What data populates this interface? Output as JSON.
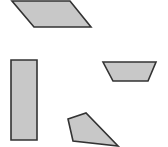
{
  "diagram": {
    "background": "#ffffff",
    "fill_color": "#c8c8c8",
    "stroke_color": "#333333",
    "stroke_width": 1.6,
    "shapes": [
      {
        "name": "parallelogram",
        "points": "12,1 70,1 91,27 34,27"
      },
      {
        "name": "rectangle",
        "points": "11,60 37,60 37,140 11,140"
      },
      {
        "name": "trapezoid",
        "points": "103,62 156,62 148,81 113,81"
      },
      {
        "name": "pentagon",
        "points": "68,119 86,113 118,146 73,141"
      }
    ]
  }
}
